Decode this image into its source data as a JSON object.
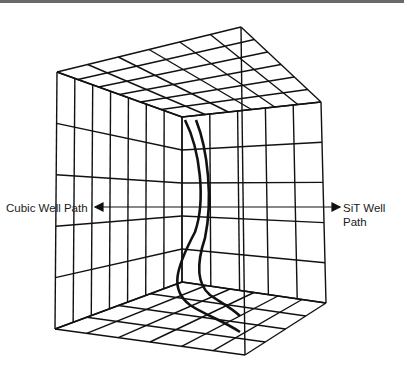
{
  "figure": {
    "labels": {
      "left": "Cubic Well Path",
      "right_line1": "SiT Well",
      "right_line2": "Path"
    },
    "colors": {
      "line": "#111111",
      "border": "#6a6a6a",
      "background": "#ffffff"
    },
    "geometry": {
      "ceiling": {
        "front_left": [
          57,
          72
        ],
        "back_apex": [
          241,
          27
        ],
        "front_right": [
          321,
          102
        ],
        "inner": [
          182,
          117
        ],
        "divisions_u": 6,
        "divisions_v": 6
      },
      "left_wall": {
        "top_outer": [
          57,
          72
        ],
        "top_inner": [
          182,
          117
        ],
        "bottom_outer": [
          55,
          329
        ],
        "bottom_inner": [
          182,
          282
        ],
        "divisions_h": 7,
        "divisions_v": 5
      },
      "right_wall": {
        "top_inner": [
          182,
          117
        ],
        "top_outer": [
          321,
          102
        ],
        "bottom_inner": [
          182,
          282
        ],
        "bottom_outer": [
          326,
          303
        ],
        "divisions_h": 5,
        "divisions_v": 5
      },
      "floor": {
        "back_left": [
          55,
          329
        ],
        "back_inner": [
          182,
          282
        ],
        "right": [
          326,
          303
        ],
        "front": [
          245,
          355
        ],
        "divisions_u": 4,
        "divisions_v": 6
      },
      "front_edge": {
        "top": [
          241,
          27
        ],
        "bottom": [
          245,
          355
        ]
      }
    },
    "well_paths": [
      {
        "name": "Cubic Well Path",
        "points": "M185,120 C200,150 206,200 195,232 C175,270 170,290 190,305 C205,315 222,320 240,332"
      },
      {
        "name": "SiT Well Path",
        "points": "M196,120 C208,150 213,200 205,238 C195,268 198,285 210,295 C220,302 232,308 240,316"
      }
    ],
    "arrows": {
      "left": {
        "from": [
          182,
          207
        ],
        "to": [
          95,
          207
        ]
      },
      "right": {
        "from": [
          182,
          207
        ],
        "to": [
          340,
          207
        ]
      }
    }
  }
}
